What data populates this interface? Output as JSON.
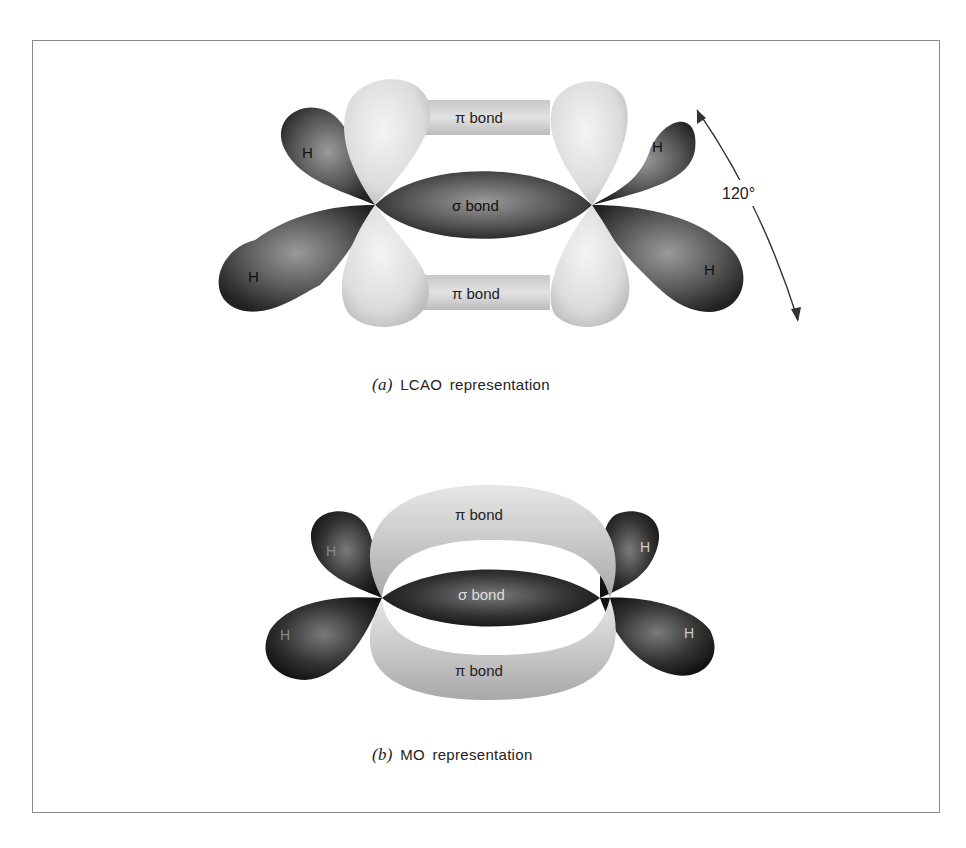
{
  "figure": {
    "panel_a": {
      "labels": {
        "pi_top": "π bond",
        "sigma": "σ bond",
        "pi_bottom": "π bond",
        "h_top_left": "H",
        "h_bottom_left": "H",
        "h_top_right": "H",
        "h_bottom_right": "H",
        "angle": "120°"
      },
      "caption_letter": "(a)",
      "caption_text": "LCAO representation"
    },
    "panel_b": {
      "labels": {
        "pi_top": "π bond",
        "sigma": "σ bond",
        "pi_bottom": "π bond",
        "h_top_left": "H",
        "h_bottom_left": "H",
        "h_top_right": "H",
        "h_bottom_right": "H"
      },
      "caption_letter": "(b)",
      "caption_text": "MO representation"
    }
  }
}
